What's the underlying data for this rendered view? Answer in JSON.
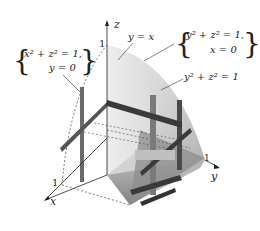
{
  "figure": {
    "axes": {
      "x_label": "x",
      "y_label": "y",
      "z_label": "z",
      "x_tick": "1",
      "y_tick": "1",
      "z_tick": "1"
    },
    "annotations": {
      "left_curve": {
        "line1": "x² + z² = 1,",
        "line2": "y = 0"
      },
      "plane": "y = x",
      "right_curve": {
        "line1": "y² + z² = 1,",
        "line2": "x = 0"
      },
      "surface": "y² + z² = 1"
    },
    "colors": {
      "surface_light": "#e6e6e6",
      "surface_mid": "#c8c8c8",
      "surface_dark": "#8a8a8a",
      "bar_dark": "#3a3a3a",
      "bar_mid": "#6e6e6e",
      "line": "#333333"
    }
  }
}
